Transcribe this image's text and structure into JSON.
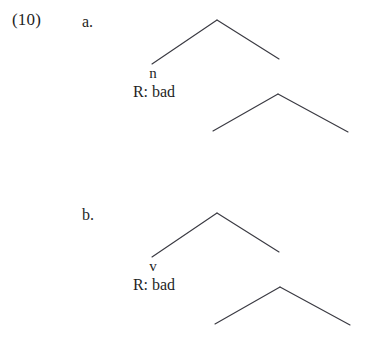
{
  "page": {
    "background_color": "#ffffff",
    "text_color": "#1f1f1f",
    "line_color": "#3a3a42"
  },
  "example": {
    "number_label": "(10)",
    "items": [
      {
        "letter": "a.",
        "head_label": "n",
        "root_label": "R: bad"
      },
      {
        "letter": "b.",
        "head_label": "v",
        "root_label": "R: bad"
      }
    ]
  }
}
